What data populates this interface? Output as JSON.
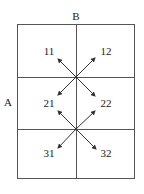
{
  "diagram": {
    "top_label": "B",
    "side_label": "A",
    "cells": [
      {
        "row": 1,
        "label_left": "11",
        "label_right": "12"
      },
      {
        "row": 2,
        "label_left": "21",
        "label_right": "22"
      },
      {
        "row": 3,
        "label_left": "31",
        "label_right": "32"
      }
    ],
    "junctions": [
      {
        "between_rows": [
          1,
          2
        ],
        "arrows": [
          "to-11",
          "to-12",
          "to-21",
          "to-22"
        ]
      },
      {
        "between_rows": [
          2,
          3
        ],
        "arrows": [
          "to-21",
          "to-22",
          "to-31",
          "to-32"
        ]
      }
    ],
    "colors": {
      "line": "#555555",
      "arrow": "#333333",
      "text": "#222222"
    }
  }
}
